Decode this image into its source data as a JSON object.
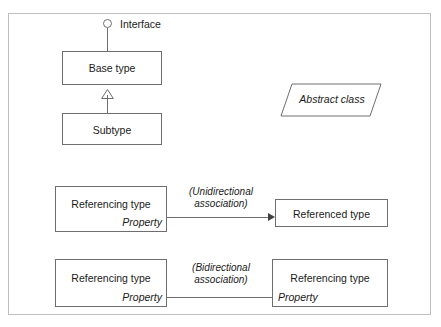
{
  "diagram": {
    "frame_color": "#bfbfbf",
    "line_color": "#6e6e6e",
    "text_color": "#1a1a1a"
  },
  "interface": {
    "label": "Interface",
    "icon": "lollipop-circle-icon"
  },
  "inheritance": {
    "base_type": "Base type",
    "subtype": "Subtype",
    "arrow_icon": "hollow-triangle-up-icon"
  },
  "abstract": {
    "label": "Abstract class",
    "shape": "parallelogram"
  },
  "unidirectional": {
    "source_title": "Referencing type",
    "source_property": "Property",
    "label_line1": "(Unidirectional",
    "label_line2": "association)",
    "target_title": "Referenced type",
    "arrow_icon": "solid-arrowhead-right-icon"
  },
  "bidirectional": {
    "source_title": "Referencing type",
    "source_property": "Property",
    "label_line1": "(Bidirectional",
    "label_line2": "association)",
    "target_title": "Referencing type",
    "target_property": "Property"
  }
}
